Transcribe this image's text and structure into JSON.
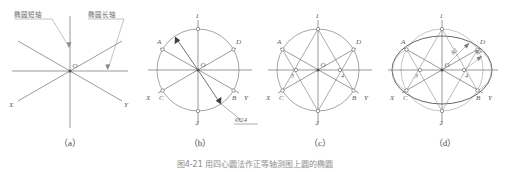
{
  "figure": {
    "caption": "图4-21  用四心圆法作正等轴测图上圆的椭圆",
    "panels": [
      {
        "key": "a",
        "caption": "（a）"
      },
      {
        "key": "b",
        "caption": "（b）"
      },
      {
        "key": "c",
        "caption": "（c）"
      },
      {
        "key": "d",
        "caption": "（d）"
      }
    ]
  },
  "colors": {
    "line": "#6e6e6e",
    "construction": "#8a8a8a",
    "thin": "#a5a5a5",
    "text": "#5a5a5a",
    "caption": "#4a4a4a",
    "background": "#ffffff"
  },
  "panel_a": {
    "leader_left_label": "椭圆短轴",
    "leader_right_label": "椭圆长轴",
    "origin_label": "O",
    "axis_x_label": "X",
    "axis_y_label": "Y"
  },
  "panel_b": {
    "origin_label": "O",
    "axis_x_label": "X",
    "axis_y_label": "Y",
    "dimension": "Ø24",
    "points": [
      {
        "id": "1",
        "label": "1"
      },
      {
        "id": "2",
        "label": "2"
      },
      {
        "id": "A",
        "label": "A"
      },
      {
        "id": "B",
        "label": "B"
      },
      {
        "id": "C",
        "label": "C"
      },
      {
        "id": "D",
        "label": "D"
      }
    ]
  },
  "panel_c": {
    "origin_label": "O",
    "axis_x_label": "X",
    "axis_y_label": "Y",
    "points": [
      {
        "id": "1",
        "label": "1"
      },
      {
        "id": "2",
        "label": "2"
      },
      {
        "id": "3",
        "label": "3"
      },
      {
        "id": "4",
        "label": "4"
      },
      {
        "id": "A",
        "label": "A"
      },
      {
        "id": "B",
        "label": "B"
      },
      {
        "id": "C",
        "label": "C"
      },
      {
        "id": "D",
        "label": "D"
      }
    ]
  },
  "panel_d": {
    "origin_label": "O",
    "axis_x_label": "X",
    "axis_y_label": "Y",
    "radius_large": "R1",
    "radius_small": "R2",
    "points": [
      {
        "id": "1",
        "label": "1"
      },
      {
        "id": "2",
        "label": "2"
      },
      {
        "id": "3",
        "label": "3"
      },
      {
        "id": "4",
        "label": "4"
      },
      {
        "id": "A",
        "label": "A"
      },
      {
        "id": "B",
        "label": "B"
      },
      {
        "id": "C",
        "label": "C"
      },
      {
        "id": "D",
        "label": "D"
      }
    ]
  }
}
